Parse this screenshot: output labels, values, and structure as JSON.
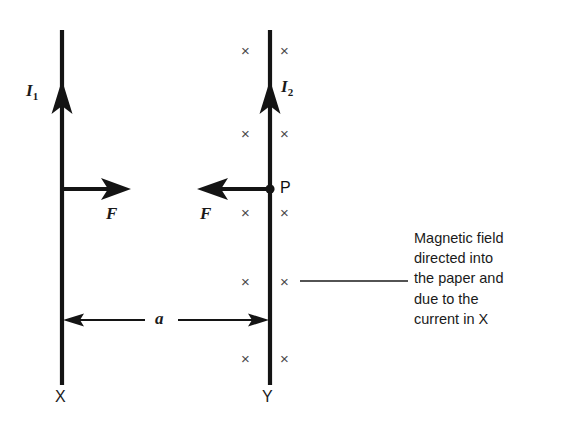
{
  "diagram": {
    "background_color": "#ffffff",
    "wire_color": "#141414",
    "field_symbol_color": "#4a4a4a",
    "wires": [
      {
        "id": "wire-x",
        "bottom_label": "X",
        "current_label": "I",
        "current_subscript": "1",
        "current_direction": "up",
        "x": 62,
        "top": 30,
        "bottom": 385
      },
      {
        "id": "wire-y",
        "bottom_label": "Y",
        "current_label": "I",
        "current_subscript": "2",
        "current_direction": "up",
        "x": 270,
        "top": 30,
        "bottom": 385
      }
    ],
    "forces": [
      {
        "id": "force-on-x",
        "label": "F",
        "direction": "right",
        "from_x": 62,
        "to_x": 130,
        "y": 189
      },
      {
        "id": "force-on-y",
        "label": "F",
        "direction": "left",
        "from_x": 270,
        "to_x": 198,
        "y": 189
      }
    ],
    "point": {
      "id": "point-p",
      "label": "P",
      "x": 270,
      "y": 189
    },
    "distance": {
      "label": "a",
      "y": 320,
      "from_x": 62,
      "to_x": 270
    },
    "field_symbols": {
      "glyph": "×",
      "rows_y": [
        50,
        133,
        212,
        281,
        358
      ],
      "left_x": 247,
      "right_x": 286
    },
    "annotation": {
      "lines": [
        "Magnetic field",
        "directed into",
        "the paper and",
        "due to the",
        "current in X"
      ],
      "leader_line": {
        "from_x": 300,
        "to_x": 408,
        "y": 281
      }
    }
  }
}
